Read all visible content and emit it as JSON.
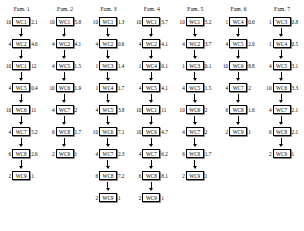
{
  "diagram": {
    "title": "",
    "node_prefix": "WC",
    "families": [
      {
        "label": "Fam. 1",
        "steps": [
          {
            "lot": "10",
            "workcenter": "WC1",
            "time": "2.1"
          },
          {
            "lot": "4",
            "workcenter": "WC2",
            "time": "4.6"
          },
          {
            "lot": "10",
            "workcenter": "WC1",
            "time": "12"
          },
          {
            "lot": "4",
            "workcenter": "WC5",
            "time": "0.4"
          },
          {
            "lot": "10",
            "workcenter": "WC6",
            "time": "11"
          },
          {
            "lot": "4",
            "workcenter": "WC7",
            "time": "5.2"
          },
          {
            "lot": "6",
            "workcenter": "WC8",
            "time": "2.6"
          },
          {
            "lot": "2",
            "workcenter": "WC9",
            "time": "1"
          }
        ]
      },
      {
        "label": "Fam. 2",
        "steps": [
          {
            "lot": "10",
            "workcenter": "WC1",
            "time": "5.8"
          },
          {
            "lot": "4",
            "workcenter": "WC2",
            "time": "4.1"
          },
          {
            "lot": "4",
            "workcenter": "WC5",
            "time": "1.5"
          },
          {
            "lot": "10",
            "workcenter": "WC6",
            "time": "1.9"
          },
          {
            "lot": "4",
            "workcenter": "WC7",
            "time": "2"
          },
          {
            "lot": "6",
            "workcenter": "WC8",
            "time": "1.7"
          },
          {
            "lot": "2",
            "workcenter": "WC9",
            "time": "1"
          }
        ]
      },
      {
        "label": "Fam. 3",
        "steps": [
          {
            "lot": "10",
            "workcenter": "WC1",
            "time": "1.3"
          },
          {
            "lot": "4",
            "workcenter": "WC2",
            "time": "0.6"
          },
          {
            "lot": "1",
            "workcenter": "WC3",
            "time": "1.4"
          },
          {
            "lot": "1",
            "workcenter": "WC4",
            "time": "1.7"
          },
          {
            "lot": "4",
            "workcenter": "WC5",
            "time": "3.8"
          },
          {
            "lot": "10",
            "workcenter": "WC6",
            "time": "7.1"
          },
          {
            "lot": "4",
            "workcenter": "WC7",
            "time": "2.3"
          },
          {
            "lot": "6",
            "workcenter": "WC8",
            "time": "7.2"
          },
          {
            "lot": "2",
            "workcenter": "WC9",
            "time": "1"
          }
        ]
      },
      {
        "label": "Fam. 4",
        "steps": [
          {
            "lot": "10",
            "workcenter": "WC1",
            "time": "3.7"
          },
          {
            "lot": "4",
            "workcenter": "WC2",
            "time": "4.1"
          },
          {
            "lot": "1",
            "workcenter": "WC4",
            "time": "0.1"
          },
          {
            "lot": "4",
            "workcenter": "WC5",
            "time": "4.1"
          },
          {
            "lot": "10",
            "workcenter": "WC1",
            "time": "11"
          },
          {
            "lot": "10",
            "workcenter": "WC6",
            "time": "4.7"
          },
          {
            "lot": "4",
            "workcenter": "WC7",
            "time": "6.2"
          },
          {
            "lot": "6",
            "workcenter": "WC8",
            "time": "8.1"
          },
          {
            "lot": "2",
            "workcenter": "WC9",
            "time": "1"
          }
        ]
      },
      {
        "label": "Fam. 5",
        "steps": [
          {
            "lot": "10",
            "workcenter": "WC1",
            "time": "5.2"
          },
          {
            "lot": "4",
            "workcenter": "WC2",
            "time": "3.7"
          },
          {
            "lot": "1",
            "workcenter": "WC3",
            "time": "0.1"
          },
          {
            "lot": "4",
            "workcenter": "WC5",
            "time": "1.5"
          },
          {
            "lot": "10",
            "workcenter": "WC6",
            "time": "2"
          },
          {
            "lot": "4",
            "workcenter": "WC7",
            "time": "2"
          },
          {
            "lot": "6",
            "workcenter": "WC8",
            "time": "1.7"
          },
          {
            "lot": "2",
            "workcenter": "WC9",
            "time": "1"
          }
        ]
      },
      {
        "label": "Fam. 6",
        "steps": [
          {
            "lot": "1",
            "workcenter": "WC4",
            "time": "0.6"
          },
          {
            "lot": "4",
            "workcenter": "WC5",
            "time": "2.0"
          },
          {
            "lot": "10",
            "workcenter": "WC6",
            "time": "8.8"
          },
          {
            "lot": "4",
            "workcenter": "WC7",
            "time": "2"
          },
          {
            "lot": "6",
            "workcenter": "WC8",
            "time": "1.6"
          },
          {
            "lot": "2",
            "workcenter": "WC9",
            "time": "1"
          }
        ]
      },
      {
        "label": "Fam. 7",
        "steps": [
          {
            "lot": "1",
            "workcenter": "WC3",
            "time": "0.8"
          },
          {
            "lot": "1",
            "workcenter": "WC4",
            "time": "0.5"
          },
          {
            "lot": "4",
            "workcenter": "WC5",
            "time": "3.1"
          },
          {
            "lot": "10",
            "workcenter": "WC6",
            "time": "3.3"
          },
          {
            "lot": "4",
            "workcenter": "WC7",
            "time": "2.1"
          },
          {
            "lot": "6",
            "workcenter": "WC8",
            "time": "2.1"
          },
          {
            "lot": "2",
            "workcenter": "WC9",
            "time": "1"
          }
        ]
      }
    ]
  }
}
